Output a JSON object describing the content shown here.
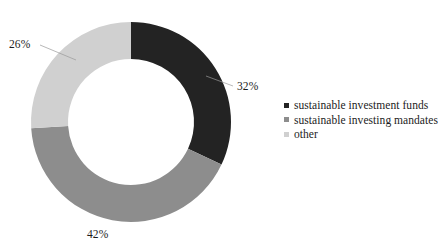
{
  "chart_data": {
    "type": "pie",
    "variant": "donut",
    "title": "",
    "subtitle": "",
    "xlabel": "",
    "ylabel": "",
    "categories": [
      "sustainable investment funds",
      "sustainable investing mandates",
      "other"
    ],
    "values": [
      32,
      42,
      26
    ],
    "value_unit": "%",
    "data_labels": [
      "32%",
      "42%",
      "26%"
    ],
    "colors": [
      "#232323",
      "#8d8d8d",
      "#d0d0d0"
    ],
    "legend_position": "right",
    "grid": false,
    "start_angle_deg": 0,
    "direction": "clockwise",
    "inner_radius_ratio": 0.63
  },
  "chart": {
    "geometry": {
      "center_x": 131,
      "center_y": 122,
      "outer_radius": 100,
      "inner_radius": 63
    },
    "slices": [
      {
        "name": "sustainable investment funds",
        "label": "32%",
        "value": 32,
        "color": "#232323",
        "label_x": 237,
        "label_y": 80
      },
      {
        "name": "sustainable investing mandates",
        "label": "42%",
        "value": 42,
        "color": "#8d8d8d",
        "label_x": 87,
        "label_y": 228
      },
      {
        "name": "other",
        "label": "26%",
        "value": 26,
        "color": "#d0d0d0",
        "label_x": 9,
        "label_y": 38
      }
    ]
  },
  "legend": {
    "items": [
      {
        "label": "sustainable investment funds",
        "color": "#232323"
      },
      {
        "label": "sustainable investing mandates",
        "color": "#8d8d8d"
      },
      {
        "label": "other",
        "color": "#d0d0d0"
      }
    ]
  },
  "leader_lines": [
    {
      "name": "leader-line-26",
      "x1": 40,
      "y1": 45,
      "x2": 76,
      "y2": 60
    },
    {
      "name": "leader-line-32",
      "x1": 233,
      "y1": 86,
      "x2": 206,
      "y2": 76
    }
  ]
}
